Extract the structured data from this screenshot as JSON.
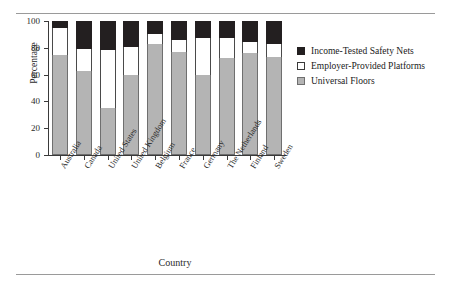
{
  "chart_data": {
    "type": "bar",
    "subtype": "stacked-bar-100",
    "title": "",
    "xlabel": "Country",
    "ylabel": "Percentage",
    "ylim": [
      0,
      100
    ],
    "yticks": [
      0,
      20,
      40,
      60,
      80,
      100
    ],
    "grid": false,
    "legend_position": "right",
    "categories": [
      "Australia",
      "Canada",
      "United States",
      "United Kingdom",
      "Belgium",
      "France",
      "Germany",
      "The Netherlands",
      "Finland",
      "Sweden"
    ],
    "series": [
      {
        "name": "Universal Floors",
        "color": "#b4b4b4",
        "values": [
          75,
          62.5,
          35,
          60,
          83,
          77,
          60,
          72.5,
          76,
          73
        ]
      },
      {
        "name": "Employer-Provided Platforms",
        "color": "#ffffff",
        "values": [
          20,
          16.5,
          43.5,
          20.5,
          7,
          9,
          27,
          15,
          8.5,
          10
        ]
      },
      {
        "name": "Income-Tested Safety Nets",
        "color": "#231f20",
        "values": [
          5,
          21,
          21.5,
          19.5,
          10,
          14,
          13,
          12.5,
          15.5,
          17
        ]
      }
    ],
    "legend_order_top_to_bottom": [
      "Income-Tested Safety Nets",
      "Employer-Provided Platforms",
      "Universal Floors"
    ]
  }
}
